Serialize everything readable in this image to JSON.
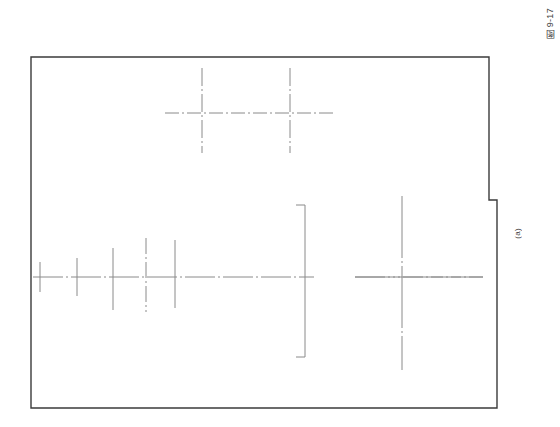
{
  "page": {
    "background_color": "#ffffff",
    "width": 560,
    "height": 427
  },
  "labels": {
    "figure_number": "图 9-17",
    "view_label": "(a)"
  },
  "colors": {
    "outline": "#3b3b3b",
    "centerline": "#8a8a8a",
    "solid_thin": "#8a8a8a"
  },
  "drawing": {
    "title": "图 9-17 (a)",
    "type": "engineering-orthographic-view",
    "outline": {
      "name": "main-part-outline",
      "points": "31,57 489,57 489,200 497,200 497,408 31,408",
      "stroke_width": 1.4,
      "closed": true,
      "description": "rectangular body outline with stepped notch at upper right"
    },
    "notch": {
      "name": "upper-right-notch",
      "x": 489,
      "y_top": 57,
      "y_bottom": 200,
      "x_right": 497
    },
    "upper_centerline_horizontal": {
      "name": "upper-horizontal-centerline",
      "x1": 165,
      "x2": 335,
      "y": 113
    },
    "upper_crosses": [
      {
        "name": "upper-cross-left",
        "cx": 202,
        "cy": 113,
        "v_top": 68,
        "v_bottom": 153
      },
      {
        "name": "upper-cross-right",
        "cx": 290,
        "cy": 113,
        "v_top": 68,
        "v_bottom": 153
      }
    ],
    "lower_centerline_horizontal_left": {
      "name": "lower-horizontal-centerline-left",
      "x1": 33,
      "x2": 314,
      "y": 277
    },
    "lower_centerline_horizontal_right": {
      "name": "lower-horizontal-centerline-right",
      "x1": 355,
      "x2": 483,
      "y": 277
    },
    "lower_vertical_marks": [
      {
        "name": "vertical-mark-1",
        "x": 40,
        "y_top": 262,
        "y_bottom": 292,
        "style": "solid"
      },
      {
        "name": "vertical-mark-2",
        "x": 77,
        "y_top": 258,
        "y_bottom": 296,
        "style": "solid"
      },
      {
        "name": "vertical-mark-3",
        "x": 113,
        "y_top": 248,
        "y_bottom": 310,
        "style": "solid"
      },
      {
        "name": "vertical-centerline-4",
        "x": 146,
        "y_top": 238,
        "y_bottom": 312,
        "style": "dash-dot"
      },
      {
        "name": "vertical-mark-5",
        "x": 175,
        "y_top": 240,
        "y_bottom": 308,
        "style": "solid"
      }
    ],
    "bracket": {
      "name": "section-bracket",
      "x_spine": 305,
      "y_top": 205,
      "y_bottom": 357,
      "tab_x_end": 296,
      "style": "solid"
    },
    "right_cross": {
      "name": "large-center-cross",
      "cx": 402,
      "cy": 277,
      "v_top": 196,
      "v_bottom": 370,
      "h_left": 355,
      "h_right": 483
    }
  }
}
